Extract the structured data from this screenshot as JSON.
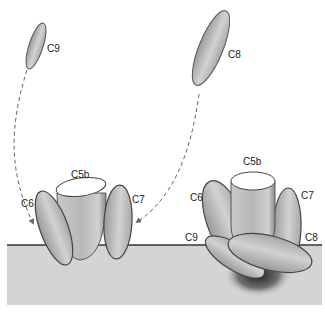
{
  "diagram": {
    "type": "complement membrane attack complex assembly",
    "colors": {
      "membrane": "#d4d4d4",
      "membrane_line": "#333333",
      "protein_fill": "#c4c4c4",
      "protein_stroke": "#555555",
      "arrow": "#666666",
      "pore_shadow": "#2a2a2a"
    },
    "left_panel": {
      "labels": {
        "c9": "C9",
        "c5b": "C5b",
        "c6": "C6",
        "c7": "C7"
      }
    },
    "right_panel": {
      "labels": {
        "c8": "C8",
        "c5b": "C5b",
        "c6": "C6",
        "c7": "C7",
        "c9": "C9",
        "c8_bound": "C8"
      }
    }
  }
}
